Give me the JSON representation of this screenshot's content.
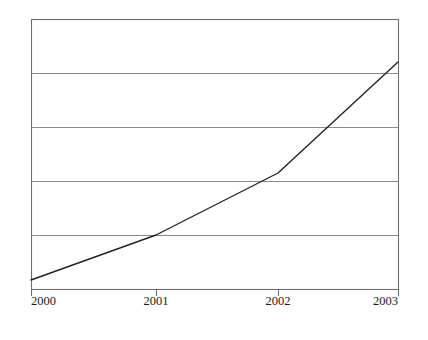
{
  "chart_data": {
    "type": "line",
    "title": "",
    "subtitle": "",
    "xlabel": "",
    "ylabel": "",
    "x": [
      2000,
      2001,
      2002,
      2003
    ],
    "xtick_labels": [
      "2000",
      "2001",
      "2002",
      "2003"
    ],
    "categories": [
      "2000",
      "2001",
      "2002",
      "2003"
    ],
    "series": [
      {
        "name": "",
        "values": [
          0.17,
          1.0,
          2.15,
          4.2
        ]
      }
    ],
    "values": [
      0.17,
      1.0,
      2.15,
      4.2
    ],
    "xlim": [
      2000,
      2003
    ],
    "ylim": [
      0,
      5
    ],
    "ytick_labels": [],
    "gridlines": {
      "horizontal": [
        1,
        2,
        3,
        4
      ],
      "vertical": [],
      "horizontal_count": 4,
      "visible": true
    },
    "legend": {
      "visible": false,
      "position": "none",
      "entries": []
    },
    "annotations": [],
    "axis": {
      "top_border": true,
      "right_border": true,
      "bottom_border": true,
      "left_border": true,
      "tick_marks_bottom": true
    },
    "colors": {
      "line": "#222222",
      "grid": "#8c8c8c",
      "frame": "#6e6e6e",
      "background": "#ffffff",
      "text": "#1a1a1a"
    }
  },
  "geometry": {
    "plot_left": 31,
    "plot_right": 398,
    "plot_top": 19,
    "plot_bottom": 289,
    "gridline_y": [
      73,
      127,
      181,
      235
    ],
    "tick_x": [
      31,
      156,
      278,
      398
    ],
    "point_y": [
      280,
      235,
      173,
      62
    ],
    "tick_label_y": 305
  }
}
